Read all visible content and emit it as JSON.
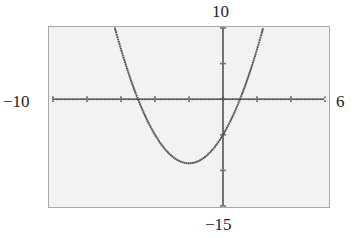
{
  "window": {
    "xmin_label": "−10",
    "xmax_label": "6",
    "ymax_label": "10",
    "ymin_label": "−15"
  },
  "colors": {
    "background": "#ffffff",
    "plot_background": "#f2f2f2",
    "frame": "#a8a8a8",
    "ink": "#555555"
  },
  "chart_data": {
    "type": "line",
    "title": "",
    "xlabel": "",
    "ylabel": "",
    "function": "y = x^2 + 4x - 5",
    "xlim": [
      -10,
      6
    ],
    "ylim": [
      -15,
      10
    ],
    "xscale": 2,
    "yscale": 5,
    "grid": false,
    "legend": null,
    "x_tick_values": [
      -10,
      -8,
      -6,
      -4,
      -2,
      0,
      2,
      4,
      6
    ],
    "y_tick_values": [
      -15,
      -10,
      -5,
      0,
      5,
      10
    ],
    "annotations": [
      "window labels: Xmin -10, Xmax 6, Ymin -15, Ymax 10"
    ],
    "series": [
      {
        "name": "f(x)",
        "x": [
          -6.35,
          -6,
          -5,
          -4,
          -3,
          -2,
          -1,
          0,
          1,
          2,
          2.35
        ],
        "y": [
          10,
          7,
          0,
          -5,
          -8,
          -9,
          -8,
          -5,
          0,
          7,
          10
        ]
      }
    ],
    "key_points": {
      "vertex": [
        -2,
        -9
      ],
      "x_intercepts": [
        -5,
        1
      ],
      "y_intercept": -5
    }
  }
}
